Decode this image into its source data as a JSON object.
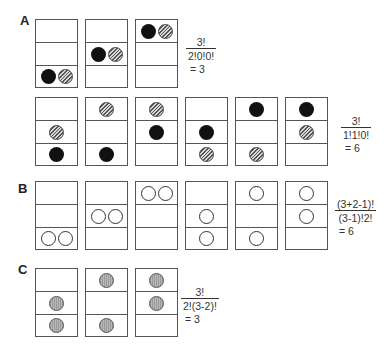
{
  "panels": {
    "A": {
      "label": "A",
      "row1": {
        "boxes": [
          {
            "cells": [
              [],
              [],
              [
                "black",
                "hatched"
              ]
            ]
          },
          {
            "cells": [
              [],
              [
                "black",
                "hatched"
              ],
              []
            ]
          },
          {
            "cells": [
              [
                "black",
                "hatched"
              ],
              [],
              []
            ]
          }
        ],
        "formula": {
          "numerator": "3!",
          "denominator": "2!0!0!",
          "result": "= 3"
        }
      },
      "row2": {
        "boxes": [
          {
            "cells": [
              [],
              [
                "hatched"
              ],
              [
                "black"
              ]
            ]
          },
          {
            "cells": [
              [
                "hatched"
              ],
              [],
              [
                "black"
              ]
            ]
          },
          {
            "cells": [
              [
                "hatched"
              ],
              [
                "black"
              ],
              []
            ]
          },
          {
            "cells": [
              [],
              [
                "black"
              ],
              [
                "hatched"
              ]
            ]
          },
          {
            "cells": [
              [
                "black"
              ],
              [],
              [
                "hatched"
              ]
            ]
          },
          {
            "cells": [
              [
                "black"
              ],
              [
                "hatched"
              ],
              []
            ]
          }
        ],
        "formula": {
          "numerator": "3!",
          "denominator": "1!1!0!",
          "result": "= 6"
        }
      }
    },
    "B": {
      "label": "B",
      "boxes": [
        {
          "cells": [
            [],
            [],
            [
              "open",
              "open"
            ]
          ]
        },
        {
          "cells": [
            [],
            [
              "open",
              "open"
            ],
            []
          ]
        },
        {
          "cells": [
            [
              "open",
              "open"
            ],
            [],
            []
          ]
        },
        {
          "cells": [
            [],
            [
              "open"
            ],
            [
              "open"
            ]
          ]
        },
        {
          "cells": [
            [
              "open"
            ],
            [],
            [
              "open"
            ]
          ]
        },
        {
          "cells": [
            [
              "open"
            ],
            [
              "open"
            ],
            []
          ]
        }
      ],
      "formula": {
        "numerator": "(3+2-1)!",
        "denominator": "(3-1)!2!",
        "result": "= 6"
      }
    },
    "C": {
      "label": "C",
      "boxes": [
        {
          "cells": [
            [],
            [
              "gray"
            ],
            [
              "gray"
            ]
          ]
        },
        {
          "cells": [
            [
              "gray"
            ],
            [],
            [
              "gray"
            ]
          ]
        },
        {
          "cells": [
            [
              "gray"
            ],
            [
              "gray"
            ],
            []
          ]
        }
      ],
      "formula": {
        "numerator": "3!",
        "denominator": "2!(3-2)!",
        "result": "= 3"
      }
    }
  },
  "colors": {
    "black_ball": "#111111",
    "hatched_ball": "#888888",
    "open_ball": "#ffffff",
    "gray_ball": "#aaaaaa",
    "box_border": "#555555"
  }
}
